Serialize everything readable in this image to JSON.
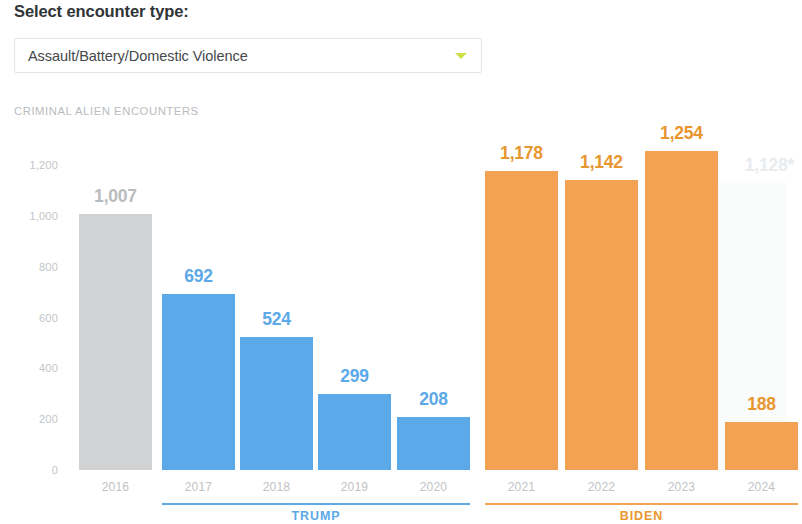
{
  "header": {
    "title": "Select encounter type:",
    "dropdown": {
      "selected": "Assault/Battery/Domestic Violence",
      "caret_icon": "chevron-down-icon",
      "caret_color": "#cde04a"
    }
  },
  "chart_eyebrow": "CRIMINAL ALIEN ENCOUNTERS",
  "chart_data": {
    "type": "bar",
    "title": "CRIMINAL ALIEN ENCOUNTERS",
    "xlabel": "",
    "ylabel": "",
    "ylim": [
      0,
      1200
    ],
    "grid": false,
    "legend": "none",
    "categories": [
      "2016",
      "2017",
      "2018",
      "2019",
      "2020",
      "2021",
      "2022",
      "2023",
      "2024"
    ],
    "values": [
      1007,
      692,
      524,
      299,
      208,
      1178,
      1142,
      1254,
      188
    ],
    "value_labels": [
      "1,007",
      "692",
      "524",
      "299",
      "208",
      "1,178",
      "1,142",
      "1,254",
      "188"
    ],
    "bar_colors": [
      "#d0d2d4",
      "#5ba9e9",
      "#5ba9e9",
      "#5ba9e9",
      "#5ba9e9",
      "#f2a252",
      "#f2a252",
      "#f2a252",
      "#f2a252"
    ],
    "yticks": [
      0,
      200,
      400,
      600,
      800,
      1000,
      1200
    ],
    "ytick_labels": [
      "0",
      "200",
      "400",
      "600",
      "800",
      "1,000",
      "1,200"
    ],
    "projection": {
      "category": "2024",
      "value": 1128,
      "label": "1,128*",
      "color": "#fafbfb"
    },
    "groups": [
      {
        "label": "TRUMP",
        "color": "#5ba9e9",
        "categories": [
          "2017",
          "2018",
          "2019",
          "2020"
        ]
      },
      {
        "label": "BIDEN",
        "color": "#f2a252",
        "categories": [
          "2021",
          "2022",
          "2023",
          "2024"
        ]
      }
    ]
  }
}
